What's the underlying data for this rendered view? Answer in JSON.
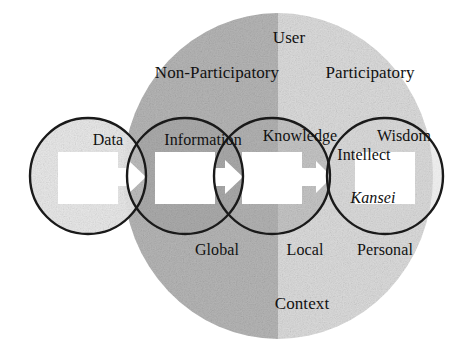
{
  "figure": {
    "name": "DIKW Kansei continuum diagram",
    "width": 470,
    "height": 359,
    "background_color": "#ffffff",
    "ink_color": "#111111"
  },
  "background_ellipse": {
    "name": "context-ellipse",
    "center_x": 278,
    "center_y": 176,
    "radius_x": 155,
    "radius_y": 163,
    "left_half_color": "#b6b6b6",
    "right_half_color": "#dcdcdc",
    "divider_x": 278
  },
  "chain_circles": [
    {
      "label": "Data",
      "label_x": 108,
      "label_y": 140,
      "center_x": 88,
      "center_y": 176,
      "radius": 58,
      "fill_color": "#e8e8e8"
    },
    {
      "label": "Information",
      "label_x": 203,
      "label_y": 140,
      "center_x": 185,
      "center_y": 176,
      "radius": 58,
      "fill_color": "#a6a6a6"
    },
    {
      "label": "Knowledge",
      "label_x": 300,
      "label_y": 136,
      "center_x": 272,
      "center_y": 176,
      "radius": 58,
      "fill_color": "#b0b0b0"
    },
    {
      "label": "Wisdom",
      "label_x": 404,
      "label_y": 136,
      "center_x": 385,
      "center_y": 176,
      "radius": 58,
      "fill_color": "#d8d8d8"
    }
  ],
  "arrows": [
    {
      "name": "data-to-information-arrow",
      "x": 123,
      "y": 176
    },
    {
      "name": "information-to-knowledge-arrow",
      "x": 220,
      "y": 176
    },
    {
      "name": "knowledge-to-wisdom-arrow",
      "x": 314,
      "y": 176
    }
  ],
  "inner_squares": [
    {
      "name": "data-square",
      "center_x": 88,
      "center_y": 178
    },
    {
      "name": "information-square",
      "center_x": 185,
      "center_y": 178
    },
    {
      "name": "knowledge-square",
      "center_x": 272,
      "center_y": 178
    },
    {
      "name": "wisdom-square",
      "center_x": 385,
      "center_y": 178
    }
  ],
  "annotations": {
    "top": {
      "user": {
        "text": "User",
        "x": 289,
        "y": 37
      },
      "non_participatory": {
        "text": "Non-Participatory",
        "x": 217,
        "y": 72
      },
      "participatory": {
        "text": "Participatory",
        "x": 370,
        "y": 72
      }
    },
    "inner": {
      "intellect": {
        "text": "Intellect",
        "x": 364,
        "y": 155
      },
      "kansei": {
        "text": "Kansei",
        "x": 373,
        "y": 198
      }
    },
    "bottom": {
      "global": {
        "text": "Global",
        "x": 217,
        "y": 250
      },
      "local": {
        "text": "Local",
        "x": 305,
        "y": 250
      },
      "personal": {
        "text": "Personal",
        "x": 385,
        "y": 250
      },
      "context": {
        "text": "Context",
        "x": 302,
        "y": 303
      }
    }
  },
  "colors": {
    "ellipse_left": "#b6b6b6",
    "ellipse_right": "#dcdcdc",
    "circle_light": "#e8e8e8",
    "circle_dark": "#a6a6a6",
    "stroke": "#1a1a1a",
    "square_fill": "#ffffff"
  }
}
